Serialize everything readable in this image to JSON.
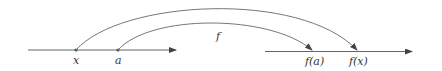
{
  "diagram": {
    "function_label": "f",
    "domain_axis": {
      "points": [
        {
          "label": "x"
        },
        {
          "label": "a"
        }
      ]
    },
    "codomain_axis": {
      "points": [
        {
          "label": "f(a)"
        },
        {
          "label": "f(x)"
        }
      ]
    },
    "colors": {
      "line": "#555555",
      "text": "#333333"
    }
  }
}
